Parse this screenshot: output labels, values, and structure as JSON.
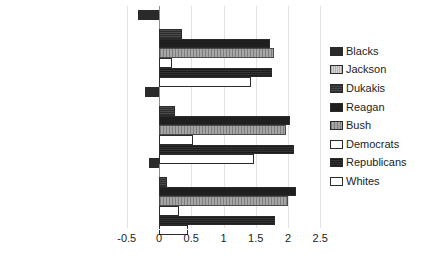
{
  "chart_data": {
    "type": "bar",
    "orientation": "horizontal",
    "title": "",
    "xlabel": "",
    "ylabel": "",
    "categories": [
      "Gov. Aid to Blacks",
      "Gov. Guarantee Jobs",
      "Defense Spending"
    ],
    "series": [
      {
        "name": "Blacks",
        "color": "#2a2a2a",
        "pattern": "solid-dark",
        "values": [
          -0.33,
          -0.22,
          -0.15
        ]
      },
      {
        "name": "Jackson",
        "color": "#c9c9c9",
        "pattern": "light-hatch",
        "values": [
          0.0,
          0.0,
          0.0
        ]
      },
      {
        "name": "Dukakis",
        "color": "#3a3a3a",
        "pattern": "dark-hatch",
        "values": [
          0.35,
          0.25,
          0.13
        ]
      },
      {
        "name": "Reagan",
        "color": "#1f1f1f",
        "pattern": "solid-black",
        "values": [
          1.72,
          2.03,
          2.13
        ]
      },
      {
        "name": "Bush",
        "color": "#8e8e8e",
        "pattern": "gray-hatch",
        "values": [
          1.78,
          1.97,
          2.0
        ]
      },
      {
        "name": "Democrats",
        "color": "#ffffff",
        "pattern": "white",
        "values": [
          0.2,
          0.53,
          0.31
        ]
      },
      {
        "name": "Republicans",
        "color": "#262626",
        "pattern": "dark-hatch",
        "values": [
          1.75,
          2.1,
          1.8
        ]
      },
      {
        "name": "Whites",
        "color": "#ffffff",
        "pattern": "white",
        "values": [
          1.42,
          1.48,
          0.45
        ]
      }
    ],
    "xticks": [
      -0.5,
      0,
      0.5,
      1,
      1.5,
      2,
      2.5
    ],
    "xtick_labels": [
      "-0.5",
      "0",
      "0.5",
      "1",
      "1.5",
      "2",
      "2.5"
    ],
    "xlim": [
      -0.5,
      2.5
    ],
    "grid": true,
    "legend_position": "right"
  },
  "legend": {
    "items": [
      {
        "label": "Blacks",
        "swatch": "swatch-blacks"
      },
      {
        "label": "Jackson",
        "swatch": "swatch-jackson"
      },
      {
        "label": "Dukakis",
        "swatch": "swatch-dukakis"
      },
      {
        "label": "Reagan",
        "swatch": "swatch-reagan"
      },
      {
        "label": "Bush",
        "swatch": "swatch-bush"
      },
      {
        "label": "Democrats",
        "swatch": "swatch-democrats"
      },
      {
        "label": "Republicans",
        "swatch": "swatch-republicans"
      },
      {
        "label": "Whites",
        "swatch": "swatch-whites"
      }
    ]
  }
}
